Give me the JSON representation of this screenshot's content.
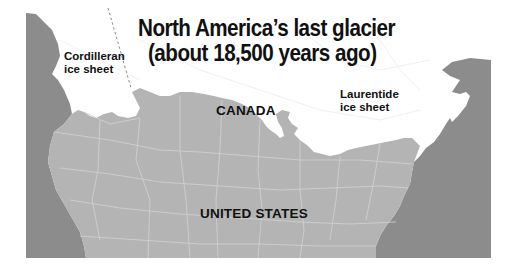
{
  "title": {
    "line1": "North America’s last glacier",
    "line2": "(about 18,500 years ago)"
  },
  "labels": {
    "cordilleran": {
      "line1": "Cordilleran",
      "line2": "ice sheet"
    },
    "laurentide": {
      "line1": "Laurentide",
      "line2": "ice sheet"
    },
    "canada": "CANADA",
    "united_states": "UNITED STATES"
  },
  "legend_colors": {
    "ocean": "#8c8c8c",
    "unglaciated_land": "#b4b4b4",
    "ice_sheet": "#ffffff",
    "boundary_lines": "#d2d2d2",
    "ice_divide_dashed": "#8a8a8a"
  }
}
